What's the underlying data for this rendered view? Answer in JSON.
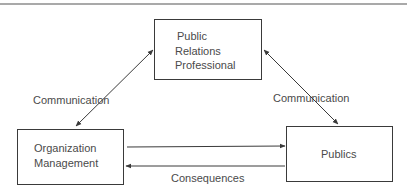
{
  "diagram": {
    "nodes": {
      "pr_professional": {
        "lines": [
          "Public",
          "Relations",
          "Professional"
        ]
      },
      "organization": {
        "lines": [
          "Organization",
          "Management"
        ]
      },
      "publics": {
        "label": "Publics"
      }
    },
    "edges": {
      "left_diagonal": {
        "label": "Communication",
        "from": "organization",
        "to": "pr_professional",
        "bidirectional": true
      },
      "right_diagonal": {
        "label": "Communication",
        "from": "publics",
        "to": "pr_professional",
        "bidirectional": true
      },
      "org_to_publics": {
        "label": "",
        "from": "organization",
        "to": "publics"
      },
      "publics_to_org": {
        "label": "Consequences",
        "from": "publics",
        "to": "organization"
      }
    }
  }
}
